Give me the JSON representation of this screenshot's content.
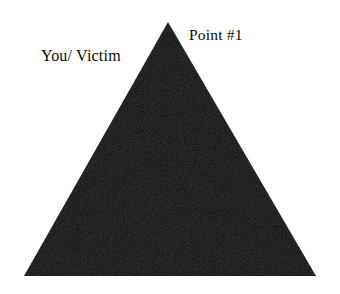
{
  "figure": {
    "kind": "triangle-diagram",
    "background_color": "#ffffff",
    "shape": {
      "name": "filled-triangle",
      "fill_color": "#0a0a0a",
      "vertices": [
        {
          "name": "apex",
          "x": 168,
          "y": 22
        },
        {
          "name": "bottom-left",
          "x": 24,
          "y": 276
        },
        {
          "name": "bottom-right",
          "x": 316,
          "y": 276
        }
      ]
    },
    "labels": [
      {
        "id": "point1",
        "text": "Point #1",
        "color": "#0b0b0b",
        "position": "upper-right-of-apex"
      },
      {
        "id": "you_victim",
        "text": "You/ Victim",
        "color": "#0b0b0b",
        "position": "upper-left"
      }
    ]
  }
}
